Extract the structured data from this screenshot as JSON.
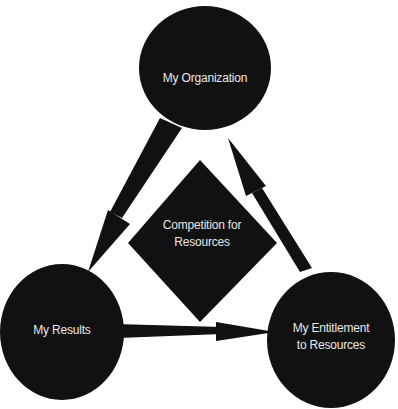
{
  "diagram": {
    "nodes": [
      {
        "id": "organization",
        "label": "My Organization",
        "shape": "circle"
      },
      {
        "id": "results",
        "label": "My Results",
        "shape": "circle"
      },
      {
        "id": "entitlement",
        "label_line1": "My Entitlement",
        "label_line2": "to Resources",
        "shape": "circle"
      },
      {
        "id": "competition",
        "label_line1": "Competition for",
        "label_line2": "Resources",
        "shape": "diamond"
      }
    ],
    "edges": [
      {
        "from": "organization",
        "to": "results"
      },
      {
        "from": "results",
        "to": "entitlement"
      },
      {
        "from": "entitlement",
        "to": "organization"
      }
    ],
    "colors": {
      "fill": "#111111",
      "text": "#e8e8e8",
      "background": "#ffffff"
    }
  }
}
